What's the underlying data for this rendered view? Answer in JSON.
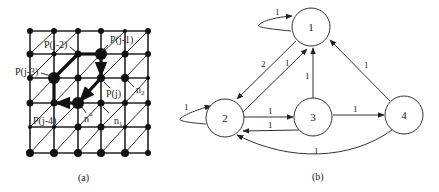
{
  "panel_a": {
    "caption": "(a)",
    "grid": {
      "cols_x": [
        30,
        54,
        78,
        101,
        125,
        148
      ],
      "rows_y": [
        31,
        54,
        78,
        103,
        127,
        153
      ]
    },
    "labels": {
      "pj2": "P(j-2)",
      "pj1": "P(j-1)",
      "pj3": "P(j-3)",
      "pj": "P(j)",
      "pj4": "P(j-4)",
      "nstar": "n",
      "nstar_sup": "*",
      "n1": "n",
      "n1_sub": "1",
      "n2": "n",
      "n2_sub": "2"
    }
  },
  "panel_b": {
    "caption": "(b)",
    "nodes": [
      {
        "id": "1",
        "label": "1"
      },
      {
        "id": "2",
        "label": "2"
      },
      {
        "id": "3",
        "label": "3"
      },
      {
        "id": "4",
        "label": "4"
      }
    ],
    "edges": [
      {
        "from": "1",
        "to": "1",
        "weight": "1"
      },
      {
        "from": "1",
        "to": "2",
        "weight": "2"
      },
      {
        "from": "2",
        "to": "1",
        "weight": "1"
      },
      {
        "from": "3",
        "to": "1",
        "weight": "1"
      },
      {
        "from": "4",
        "to": "1",
        "weight": "1"
      },
      {
        "from": "2",
        "to": "2",
        "weight": "1"
      },
      {
        "from": "2",
        "to": "3",
        "weight": "1"
      },
      {
        "from": "3",
        "to": "2",
        "weight": "1"
      },
      {
        "from": "3",
        "to": "4",
        "weight": "1"
      },
      {
        "from": "4",
        "to": "2",
        "weight": "1"
      }
    ]
  }
}
